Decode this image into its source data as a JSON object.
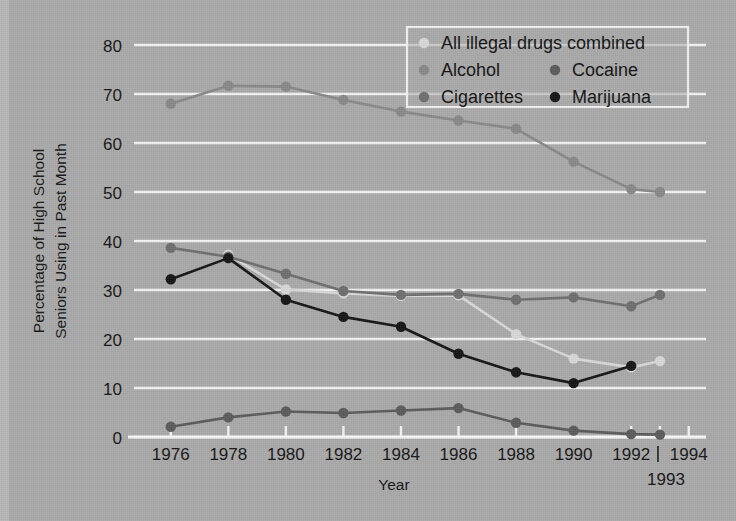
{
  "chart_data": {
    "type": "line",
    "title": "",
    "xlabel": "Year",
    "ylabel": "Percentage of High School Seniors Using in Past Month",
    "ylabel_line1": "Percentage of High School",
    "ylabel_line2": "Seniors Using in Past Month",
    "ylim": [
      0,
      80
    ],
    "ytick_labels": [
      "0",
      "10",
      "20",
      "30",
      "40",
      "50",
      "60",
      "70",
      "80"
    ],
    "ytick_values": [
      0,
      10,
      20,
      30,
      40,
      50,
      60,
      70,
      80
    ],
    "xtick_labels": [
      "1976",
      "1978",
      "1980",
      "1982",
      "1984",
      "1986",
      "1988",
      "1990",
      "1992",
      "1994"
    ],
    "xtick_values": [
      1976,
      1978,
      1980,
      1982,
      1984,
      1986,
      1988,
      1990,
      1992,
      1994
    ],
    "xlim": [
      1975,
      1994.6
    ],
    "extra_xtick_label": "1993",
    "extra_xtick_value": 1993,
    "grid": "horizontal",
    "legend_position": "top-right",
    "x": [
      1976,
      1978,
      1980,
      1982,
      1984,
      1986,
      1988,
      1990,
      1992,
      1993
    ],
    "series": [
      {
        "name": "All illegal drugs combined",
        "color": "#d8d8d8",
        "values": [
          null,
          37.2,
          30.1,
          29.3,
          28.8,
          28.9,
          21.0,
          16.0,
          14.2,
          15.5
        ]
      },
      {
        "name": "Alcohol",
        "color": "#888888",
        "values": [
          68.0,
          71.7,
          71.5,
          68.8,
          66.4,
          64.6,
          62.9,
          56.2,
          50.6,
          50.0
        ]
      },
      {
        "name": "Cigarettes",
        "color": "#6e6e6e",
        "values": [
          38.6,
          36.8,
          33.3,
          29.8,
          29.0,
          29.2,
          28.0,
          28.5,
          26.7,
          29.0
        ]
      },
      {
        "name": "Cocaine",
        "color": "#5a5a5a",
        "values": [
          2.1,
          4.0,
          5.2,
          4.9,
          5.4,
          5.9,
          2.9,
          1.3,
          0.6,
          0.5
        ]
      },
      {
        "name": "Marijuana",
        "color": "#141414",
        "values": [
          32.2,
          36.5,
          28.0,
          24.5,
          22.5,
          17.0,
          13.2,
          11.0,
          14.5,
          null
        ]
      }
    ]
  },
  "legend": {
    "entries": [
      {
        "label": "All illegal drugs combined",
        "marker_color": "#d8d8d8"
      },
      {
        "label": "Alcohol",
        "marker_color": "#888888"
      },
      {
        "label": "Cocaine",
        "marker_color": "#5a5a5a"
      },
      {
        "label": "Cigarettes",
        "marker_color": "#6e6e6e"
      },
      {
        "label": "Marijuana",
        "marker_color": "#141414"
      }
    ]
  },
  "colors": {
    "background": "#a9a9a9",
    "gridline": "#f2f2f2",
    "text": "#141414"
  }
}
